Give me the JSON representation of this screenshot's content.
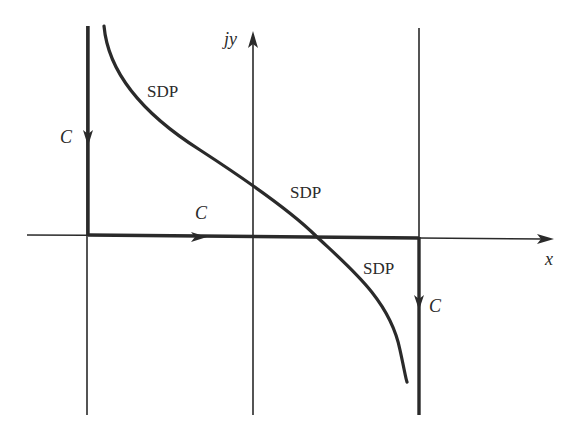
{
  "diagram": {
    "title": "",
    "colors": {
      "stroke": "#2a2a2a",
      "background": "#ffffff"
    },
    "axes": {
      "x_label": "x",
      "y_label": "jy"
    },
    "labels": {
      "contour": "C",
      "sdp": "SDP"
    },
    "elements": [
      {
        "id": "x-axis",
        "type": "axis",
        "label": "x",
        "direction": "right"
      },
      {
        "id": "y-axis",
        "type": "axis",
        "label": "jy",
        "direction": "up"
      },
      {
        "id": "left-vertical-line",
        "type": "guide-line"
      },
      {
        "id": "right-vertical-line",
        "type": "guide-line"
      },
      {
        "id": "contour-c-left",
        "type": "contour-segment",
        "label": "C",
        "direction": "down"
      },
      {
        "id": "contour-c-bottom",
        "type": "contour-segment",
        "label": "C",
        "direction": "right"
      },
      {
        "id": "contour-c-right",
        "type": "contour-segment",
        "label": "C",
        "direction": "down"
      },
      {
        "id": "sdp-curve",
        "type": "curve",
        "labels": [
          "SDP",
          "SDP",
          "SDP"
        ]
      }
    ]
  }
}
